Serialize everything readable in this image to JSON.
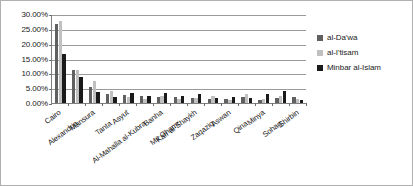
{
  "chart_data": {
    "type": "bar",
    "title": "",
    "xlabel": "",
    "ylabel": "",
    "ylim": [
      0,
      30
    ],
    "ytick_labels": [
      "30.00%",
      "25.00%",
      "20.00%",
      "15.00%",
      "10.00%",
      "5.00%",
      "0.00%"
    ],
    "ytick_values": [
      30,
      25,
      20,
      15,
      10,
      5,
      0
    ],
    "grid": true,
    "legend_position": "right",
    "categories": [
      "Cairo",
      "Alexandria",
      "Mansura",
      "Tanta",
      "Asyut",
      "Al-Mahalla al-Kubra",
      "Banha",
      "Mit Ghamr",
      "Kafr al-Shaykh",
      "Zaqaziq",
      "Aswan",
      "Qina",
      "Minya",
      "Sohag",
      "Shirbin"
    ],
    "series": [
      {
        "name": "al-Da'wa",
        "color": "#606060",
        "values": [
          26.5,
          11.2,
          5.4,
          3.2,
          2.6,
          2.3,
          1.9,
          2.1,
          1.8,
          1.4,
          1.2,
          2.1,
          1.1,
          1.6,
          2.0
        ]
      },
      {
        "name": "al-I'tisam",
        "color": "#c0c0c0",
        "values": [
          27.6,
          11.1,
          7.3,
          3.9,
          1.9,
          1.5,
          2.5,
          1.3,
          1.7,
          2.3,
          1.0,
          3.0,
          1.3,
          2.4,
          1.2
        ]
      },
      {
        "name": "Minbar al-Islam",
        "color": "#1a1a1a",
        "values": [
          16.5,
          8.7,
          3.7,
          2.0,
          3.4,
          2.5,
          3.3,
          2.4,
          3.0,
          1.7,
          2.0,
          1.6,
          3.2,
          4.1,
          1.0
        ]
      }
    ]
  },
  "legend": {
    "items": [
      {
        "label": "al-Da'wa"
      },
      {
        "label": "al-I'tisam"
      },
      {
        "label": "Minbar al-Islam"
      }
    ]
  }
}
